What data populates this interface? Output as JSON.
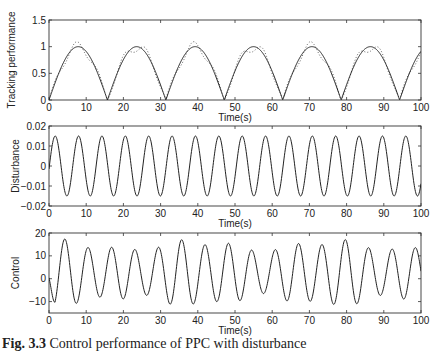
{
  "chart_data": [
    {
      "type": "line",
      "title": "",
      "xlabel": "Time(s)",
      "ylabel": "Tracking performance",
      "xlim": [
        0,
        100
      ],
      "ylim": [
        0,
        1.5
      ],
      "xticks": [
        0,
        10,
        20,
        30,
        40,
        50,
        60,
        70,
        80,
        90,
        100
      ],
      "yticks": [
        0,
        0.5,
        1,
        1.5
      ],
      "ytick_labels": [
        "0",
        "0.5",
        "1",
        "1.5"
      ],
      "grid": false,
      "series": [
        {
          "name": "reference",
          "style": "solid",
          "formula": "|sin(0.2 t)|",
          "peak": 1.0,
          "zeros_at": [
            0,
            15.7,
            31.4,
            47.1,
            62.8,
            78.5,
            94.2
          ]
        },
        {
          "name": "actual",
          "style": "dotted",
          "formula": "|sin(0.2 t)| with small oscillation",
          "peak": 1.1
        }
      ]
    },
    {
      "type": "line",
      "title": "",
      "xlabel": "Time(s)",
      "ylabel": "Disturbance",
      "xlim": [
        0,
        100
      ],
      "ylim": [
        -0.02,
        0.02
      ],
      "xticks": [
        0,
        10,
        20,
        30,
        40,
        50,
        60,
        70,
        80,
        90,
        100
      ],
      "yticks": [
        -0.02,
        -0.01,
        0,
        0.01,
        0.02
      ],
      "ytick_labels": [
        "-0.02",
        "-0.01",
        "0",
        "0.01",
        "0.02"
      ],
      "grid": false,
      "series": [
        {
          "name": "disturbance",
          "style": "solid",
          "formula": "0.015 sin(t)",
          "amplitude": 0.015,
          "period": 6.28
        }
      ]
    },
    {
      "type": "line",
      "title": "",
      "xlabel": "Time(s)",
      "ylabel": "Control",
      "xlim": [
        0,
        100
      ],
      "ylim": [
        -15,
        20
      ],
      "xticks": [
        0,
        10,
        20,
        30,
        40,
        50,
        60,
        70,
        80,
        90,
        100
      ],
      "yticks": [
        -10,
        0,
        10,
        20
      ],
      "ytick_labels": [
        "-10",
        "0",
        "10",
        "20"
      ],
      "grid": false,
      "series": [
        {
          "name": "control",
          "style": "solid",
          "approx_range": [
            -10,
            15
          ],
          "period": 6.28
        }
      ]
    }
  ],
  "caption": {
    "label": "Fig. 3.3",
    "text": " Control performance of PPC with disturbance"
  }
}
